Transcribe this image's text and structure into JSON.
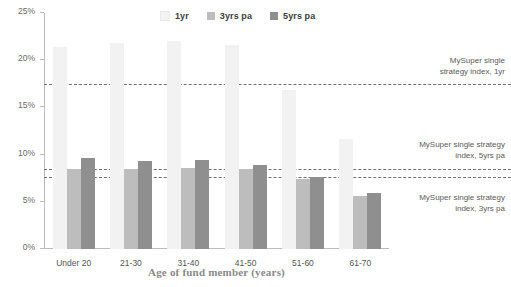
{
  "chart_data": {
    "type": "bar",
    "title": "",
    "subtitle": "",
    "xlabel": "Age of fund member (years)",
    "ylabel": "",
    "ylim": [
      0,
      25
    ],
    "yticks": [
      "0%",
      "5%",
      "10%",
      "15%",
      "20%",
      "25%"
    ],
    "ytick_values": [
      0,
      5,
      10,
      15,
      20,
      25
    ],
    "grid": false,
    "legend_position": "top-center",
    "categories": [
      "Under 20",
      "21-30",
      "31-40",
      "41-50",
      "51-60",
      "61-70"
    ],
    "series": [
      {
        "name": "1yr",
        "color": "#f2f2f2",
        "values": [
          21.4,
          21.8,
          22.0,
          21.6,
          16.8,
          11.7
        ]
      },
      {
        "name": "3yrs pa",
        "color": "#bdbdbd",
        "values": [
          8.5,
          8.5,
          8.6,
          8.5,
          7.4,
          5.6
        ]
      },
      {
        "name": "5yrs pa",
        "color": "#8f8f8f",
        "values": [
          9.6,
          9.3,
          9.4,
          8.9,
          7.6,
          5.9
        ]
      }
    ],
    "reference_lines": [
      {
        "label": "MySuper single\nstrategy index, 1yr",
        "value": 17.4
      },
      {
        "label": "MySuper single strategy\nindex, 5yrs pa",
        "value": 8.4
      },
      {
        "label": "MySuper single strategy\nindex, 3yrs pa",
        "value": 7.5
      }
    ]
  },
  "legend": {
    "items": [
      {
        "label": "1yr",
        "color": "#f2f2f2"
      },
      {
        "label": "3yrs pa",
        "color": "#bdbdbd"
      },
      {
        "label": "5yrs pa",
        "color": "#8f8f8f"
      }
    ]
  }
}
